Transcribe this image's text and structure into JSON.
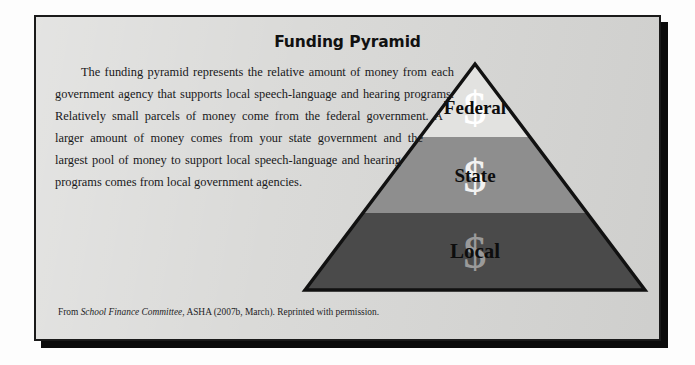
{
  "figure": {
    "title": "Funding Pyramid",
    "body_paragraph": "The funding pyramid represents the relative amount of money from each government agency that supports local speech-language and hearing programs. Relatively small parcels of money come from the federal government. A larger amount of money comes from your state government and the largest pool of money to support local speech-language and hearing programs comes from local government agencies.",
    "caption": {
      "prefix": "From ",
      "source_title": "School Finance Committee",
      "suffix": ", ASHA (2007b, March). Reprinted with permission."
    }
  },
  "background_ghost": {
    "heading": "[6] Public Education Organizational Structures",
    "line_a": "the organizational structure of your local education agency",
    "line_b": "speech-language pathologists and audiologists in the schools"
  },
  "chart_data": {
    "type": "pie",
    "title": "Funding Pyramid",
    "xlabel": "",
    "ylabel": "",
    "categories": [
      "Federal",
      "State",
      "Local"
    ],
    "values": [
      12,
      30,
      58
    ],
    "series": [
      {
        "name": "Relative funding amount",
        "values": [
          12,
          30,
          58
        ]
      }
    ],
    "legend_position": "none",
    "grid": false
  },
  "pyramid": {
    "apex": {
      "x": 473,
      "y": 62
    },
    "base_left": {
      "x": 303,
      "y": 288
    },
    "base_right": {
      "x": 643,
      "y": 288
    },
    "outline_color": "#111111",
    "dollar_glyph": "$",
    "tiers": [
      {
        "name": "federal",
        "label": "Federal",
        "fill": "#e2e2e0",
        "dollar_color": "#ffffff",
        "label_y": 112,
        "dollar_y": 122,
        "boundary_y": 135
      },
      {
        "name": "state",
        "label": "State",
        "fill": "#8e8e8e",
        "dollar_color": "#f2f2f2",
        "label_y": 180,
        "dollar_y": 190,
        "boundary_y": 211
      },
      {
        "name": "local",
        "label": "Local",
        "fill": "#4a4a4a",
        "dollar_color": "#9a9a9a",
        "label_y": 256,
        "dollar_y": 266,
        "boundary_y": 288
      }
    ]
  },
  "colors": {
    "card_background": "#d8d8d6",
    "card_border": "#1a1a1a",
    "page_background": "#fdfdfd",
    "shadow": "#0b0b0b",
    "text": "#18181a"
  }
}
